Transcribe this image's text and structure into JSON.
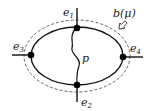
{
  "diagram": {
    "labels": {
      "e1": "e",
      "e1_sub": "1",
      "e2": "e",
      "e2_sub": "2",
      "e3": "e",
      "e3_sub": "3",
      "e4": "e",
      "e4_sub": "4",
      "path": "p",
      "boundary": "b(μ)"
    },
    "colors": {
      "stroke": "#111111",
      "dashed": "#555555",
      "background": "#ffffff"
    }
  }
}
